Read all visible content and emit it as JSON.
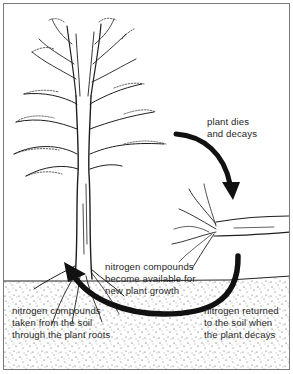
{
  "diagram": {
    "labels": {
      "plant_dies": "plant dies\nand decays",
      "compounds_available": "nitrogen compounds\nbecome available for\nnew plant growth",
      "compounds_taken": "nitrogen compounds\ntaken from the soil\nthrough the plant roots",
      "nitrogen_returned": "nitrogen returned\nto the soil when\nthe plant decays"
    },
    "elements": {
      "tree": "living tree with roots in soil",
      "fallen_plant": "fallen decaying plant on ground",
      "soil": "stippled soil layer",
      "arrow_decay": "curved arrow from tree to fallen plant",
      "arrow_recycle": "curved arrow from decaying plant back to tree roots"
    },
    "colors": {
      "ink": "#1a1a1a",
      "paper": "#ffffff",
      "border": "#7a7a7a"
    }
  }
}
